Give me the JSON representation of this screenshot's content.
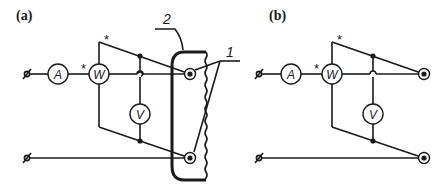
{
  "panels": [
    {
      "label": "(a)",
      "meters": {
        "ammeter": "A",
        "wattmeter": "W",
        "voltmeter": "V"
      },
      "polarity_marks": [
        "*",
        "*"
      ],
      "callouts": {
        "housing": "2",
        "terminals": "1"
      }
    },
    {
      "label": "(b)",
      "meters": {
        "ammeter": "A",
        "wattmeter": "W",
        "voltmeter": "V"
      },
      "polarity_marks": [
        "*",
        "*"
      ]
    }
  ],
  "colors": {
    "line": "#1a1a1a",
    "background": "#ffffff"
  }
}
